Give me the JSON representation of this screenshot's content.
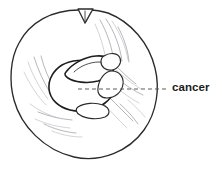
{
  "figure": {
    "type": "medical-line-illustration",
    "background_color": "#ffffff",
    "line_color": "#2b2b2b",
    "texture_color": "#9a9aa0"
  },
  "annotations": {
    "callout": {
      "label": "cancer",
      "leader_style": "dashed",
      "leader_color": "#555555",
      "points_to": "central-tumor-mass"
    }
  },
  "shapes": {
    "outer_circle": {
      "name": "breast-outline",
      "center_x": 84,
      "center_y": 86,
      "radius_x": 73,
      "radius_y": 72
    },
    "top_notch": {
      "name": "nipple-notch",
      "x": 78,
      "y": 9
    },
    "tumor_mass": {
      "name": "tumor-mass",
      "center_x": 82,
      "center_y": 78
    },
    "lower_lobule": {
      "name": "lower-lobule",
      "center_x": 93,
      "center_y": 108
    }
  }
}
